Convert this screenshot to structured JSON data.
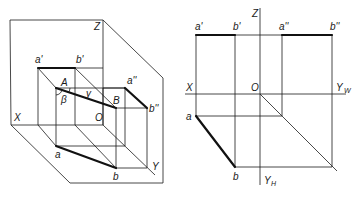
{
  "left_figure": {
    "description": "Axonometric view of line segment AB in three projection planes",
    "labels": {
      "z": "Z",
      "x": "X",
      "y": "Y",
      "o": "O",
      "a_prime": "a'",
      "b_prime": "b'",
      "a_dprime": "a''",
      "b_dprime": "b''",
      "A": "A",
      "B": "B",
      "a": "a",
      "b": "b",
      "beta": "β",
      "gamma": "γ"
    }
  },
  "right_figure": {
    "description": "Orthographic three-view projection of segment AB",
    "labels": {
      "z": "Z",
      "x": "X",
      "o": "O",
      "yw": "Y",
      "yw_sub": "W",
      "yh": "Y",
      "yh_sub": "H",
      "a_prime": "a'",
      "b_prime": "b'",
      "a_dprime": "a''",
      "b_dprime": "b''",
      "a": "a",
      "b": "b"
    }
  },
  "colors": {
    "line": "#1a1a1a",
    "background": "#ffffff"
  }
}
